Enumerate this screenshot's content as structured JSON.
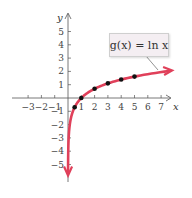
{
  "chart_data": {
    "type": "line",
    "title": "",
    "function_label": "g(x) = ln x",
    "xlabel": "x",
    "ylabel": "y",
    "xlim": [
      -3.5,
      7.8
    ],
    "ylim": [
      -5.8,
      6.2
    ],
    "x_ticks": [
      -3,
      -2,
      -1,
      1,
      2,
      3,
      4,
      5,
      6,
      7
    ],
    "x_tick_labels": [
      "−3",
      "−2",
      "−1",
      "1",
      "2",
      "3",
      "4",
      "5",
      "6",
      "7"
    ],
    "y_ticks": [
      -5,
      -4,
      -3,
      -2,
      -1,
      1,
      2,
      3,
      4,
      5
    ],
    "y_tick_labels": [
      "−5",
      "−4",
      "−3",
      "−2",
      "−1",
      "1",
      "2",
      "3",
      "4",
      "5"
    ],
    "grid": false,
    "series": [
      {
        "name": "g(x) = ln x",
        "color": "#e0405a",
        "points": [
          [
            0.5,
            -0.69
          ],
          [
            1,
            0
          ],
          [
            2,
            0.69
          ],
          [
            3,
            1.1
          ],
          [
            4,
            1.39
          ],
          [
            5,
            1.61
          ]
        ],
        "asymptote": "x = 0 (vertical, curve goes to -infinity)",
        "right_arrow_at": [
          7.9,
          2.07
        ]
      }
    ]
  },
  "colors": {
    "curve": "#e0405a",
    "axes": "#555555",
    "points": "#111111",
    "label_bg": "#f4eef2"
  }
}
